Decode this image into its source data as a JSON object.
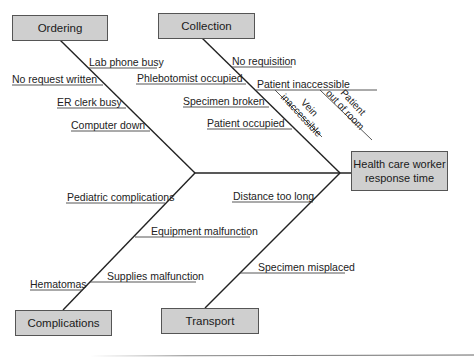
{
  "diagram": {
    "type": "fishbone",
    "effect": "Health care worker response time",
    "categories": [
      {
        "name": "Ordering",
        "causes": [
          "Lab phone busy",
          "No request written",
          "ER clerk busy",
          "Computer down"
        ]
      },
      {
        "name": "Collection",
        "causes": [
          "No requisition",
          "Phlebotomist occupied",
          "Patient inaccessible",
          "Specimen broken",
          "Patient occupied"
        ],
        "sub_causes": {
          "Patient inaccessible": [
            "Vein inaccessible",
            "Patient out of room"
          ]
        }
      },
      {
        "name": "Complications",
        "causes": [
          "Pediatric complications",
          "Equipment malfunction",
          "Supplies malfunction",
          "Hematomas"
        ]
      },
      {
        "name": "Transport",
        "causes": [
          "Distance too long",
          "Specimen misplaced"
        ]
      }
    ]
  },
  "boxes": {
    "ordering": "Ordering",
    "collection": "Collection",
    "complications": "Complications",
    "transport": "Transport",
    "effect_line1": "Health care worker",
    "effect_line2": "response time"
  },
  "labels": {
    "lab_phone_busy": "Lab phone busy",
    "no_request_written": "No request written",
    "er_clerk_busy": "ER clerk busy",
    "computer_down": "Computer down",
    "no_requisition": "No requisition",
    "phlebotomist_occupied": "Phlebotomist occupied",
    "patient_inaccessible": "Patient inaccessible",
    "specimen_broken": "Specimen broken",
    "patient_occupied": "Patient occupied",
    "vein_line1": "Vein",
    "vein_line2": "inaccessible",
    "patient_line1": "Patient",
    "patient_line2": "out of room",
    "pediatric_complications": "Pediatric complications",
    "equipment_malfunction": "Equipment malfunction",
    "supplies_malfunction": "Supplies malfunction",
    "hematomas": "Hematomas",
    "distance_too_long": "Distance too long",
    "specimen_misplaced": "Specimen misplaced"
  },
  "colors": {
    "box_fill": "#cfcfcf",
    "line": "#222222"
  }
}
